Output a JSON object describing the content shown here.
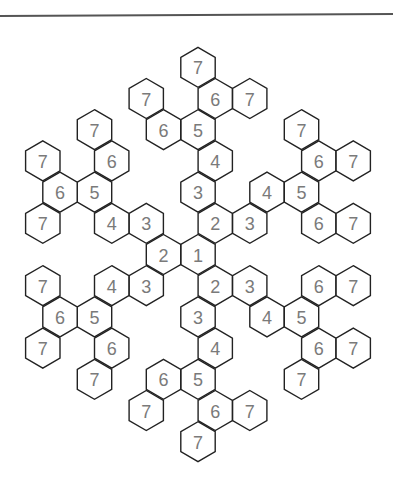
{
  "figure": {
    "title": "",
    "colors": {
      "stroke": "#222222",
      "label": "#7a7a7a",
      "rule": "#555555",
      "background": "#ffffff"
    },
    "lattice": {
      "origin_x": 198,
      "origin_y": 254.5,
      "half_step_x": 17.25,
      "row_step_y": 31.2,
      "hex_half_width": 17.2,
      "hex_half_height": 20
    },
    "cells": [
      {
        "label": "1",
        "x": 0,
        "r": 0,
        "arm": "center"
      },
      {
        "label": "2",
        "x": 1,
        "r": -1,
        "arm": "up"
      },
      {
        "label": "3",
        "x": 0,
        "r": -2,
        "arm": "up"
      },
      {
        "label": "4",
        "x": 1,
        "r": -3,
        "arm": "up"
      },
      {
        "label": "5",
        "x": 0,
        "r": -4,
        "arm": "up"
      },
      {
        "label": "6",
        "x": -2,
        "r": -4,
        "arm": "up"
      },
      {
        "label": "7",
        "x": -3,
        "r": -5,
        "arm": "up"
      },
      {
        "label": "6",
        "x": 1,
        "r": -5,
        "arm": "up"
      },
      {
        "label": "7",
        "x": 3,
        "r": -5,
        "arm": "up"
      },
      {
        "label": "7",
        "x": 0,
        "r": -6,
        "arm": "up"
      },
      {
        "label": "3",
        "x": 3,
        "r": -1,
        "arm": "upper-right"
      },
      {
        "label": "4",
        "x": 4,
        "r": -2,
        "arm": "upper-right"
      },
      {
        "label": "5",
        "x": 6,
        "r": -2,
        "arm": "upper-right"
      },
      {
        "label": "6",
        "x": 7,
        "r": -3,
        "arm": "upper-right"
      },
      {
        "label": "7",
        "x": 9,
        "r": -3,
        "arm": "upper-right"
      },
      {
        "label": "7",
        "x": 6,
        "r": -4,
        "arm": "upper-right"
      },
      {
        "label": "6",
        "x": 7,
        "r": -1,
        "arm": "upper-right"
      },
      {
        "label": "7",
        "x": 9,
        "r": -1,
        "arm": "upper-right"
      },
      {
        "label": "2",
        "x": -2,
        "r": 0,
        "arm": "left"
      },
      {
        "label": "3",
        "x": -3,
        "r": -1,
        "arm": "upper-left"
      },
      {
        "label": "4",
        "x": -5,
        "r": -1,
        "arm": "upper-left"
      },
      {
        "label": "7",
        "x": -9,
        "r": -1,
        "arm": "upper-left"
      },
      {
        "label": "5",
        "x": -6,
        "r": -2,
        "arm": "upper-left"
      },
      {
        "label": "6",
        "x": -8,
        "r": -2,
        "arm": "upper-left"
      },
      {
        "label": "6",
        "x": -5,
        "r": -3,
        "arm": "upper-left"
      },
      {
        "label": "7",
        "x": -9,
        "r": -3,
        "arm": "upper-left"
      },
      {
        "label": "7",
        "x": -6,
        "r": -4,
        "arm": "upper-left"
      },
      {
        "label": "3",
        "x": -3,
        "r": 1,
        "arm": "lower-left"
      },
      {
        "label": "4",
        "x": -5,
        "r": 1,
        "arm": "lower-left"
      },
      {
        "label": "7",
        "x": -9,
        "r": 1,
        "arm": "lower-left"
      },
      {
        "label": "5",
        "x": -6,
        "r": 2,
        "arm": "lower-left"
      },
      {
        "label": "6",
        "x": -8,
        "r": 2,
        "arm": "lower-left"
      },
      {
        "label": "6",
        "x": -5,
        "r": 3,
        "arm": "lower-left"
      },
      {
        "label": "7",
        "x": -9,
        "r": 3,
        "arm": "lower-left"
      },
      {
        "label": "7",
        "x": -6,
        "r": 4,
        "arm": "lower-left"
      },
      {
        "label": "2",
        "x": 1,
        "r": 1,
        "arm": "down"
      },
      {
        "label": "3",
        "x": 0,
        "r": 2,
        "arm": "down"
      },
      {
        "label": "4",
        "x": 1,
        "r": 3,
        "arm": "down"
      },
      {
        "label": "5",
        "x": 0,
        "r": 4,
        "arm": "down"
      },
      {
        "label": "6",
        "x": -2,
        "r": 4,
        "arm": "down"
      },
      {
        "label": "7",
        "x": -3,
        "r": 5,
        "arm": "down"
      },
      {
        "label": "6",
        "x": 1,
        "r": 5,
        "arm": "down"
      },
      {
        "label": "7",
        "x": 3,
        "r": 5,
        "arm": "down"
      },
      {
        "label": "7",
        "x": 0,
        "r": 6,
        "arm": "down"
      },
      {
        "label": "3",
        "x": 3,
        "r": 1,
        "arm": "lower-right"
      },
      {
        "label": "4",
        "x": 4,
        "r": 2,
        "arm": "lower-right"
      },
      {
        "label": "5",
        "x": 6,
        "r": 2,
        "arm": "lower-right"
      },
      {
        "label": "6",
        "x": 7,
        "r": 1,
        "arm": "lower-right"
      },
      {
        "label": "7",
        "x": 9,
        "r": 1,
        "arm": "lower-right"
      },
      {
        "label": "6",
        "x": 7,
        "r": 3,
        "arm": "lower-right"
      },
      {
        "label": "7",
        "x": 9,
        "r": 3,
        "arm": "lower-right"
      },
      {
        "label": "7",
        "x": 6,
        "r": 4,
        "arm": "lower-right"
      }
    ]
  }
}
